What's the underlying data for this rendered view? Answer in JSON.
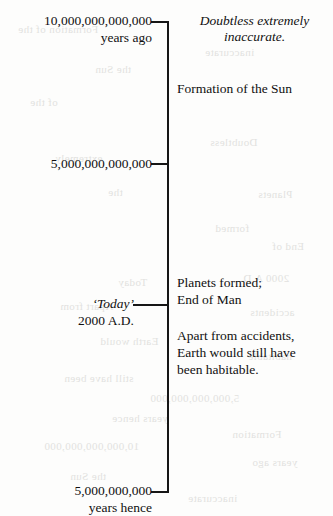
{
  "figure": {
    "type": "timeline",
    "orientation": "vertical",
    "axis_color": "#161616"
  },
  "ticks": [
    {
      "id": "ten-trillion-years-ago",
      "label_lines": [
        "10,000,000,000,000",
        "years ago"
      ],
      "position": "top"
    },
    {
      "id": "five-trillion-years-ago",
      "label_lines": [
        "5,000,000,000,000"
      ],
      "position": "upper-middle"
    },
    {
      "id": "today",
      "label_lines": [
        "‘Today’",
        "2000 A.D."
      ],
      "position": "lower-middle"
    },
    {
      "id": "five-billion-years-hence",
      "label_lines": [
        "5,000,000,000",
        "years hence"
      ],
      "position": "bottom"
    }
  ],
  "labels": {
    "top": {
      "line1": "10,000,000,000,000",
      "line2": "years ago"
    },
    "middle": {
      "line1": "5,000,000,000,000"
    },
    "today": {
      "line1": "‘Today’",
      "line2": "2000 A.D."
    },
    "bottom": {
      "line1": "5,000,000,000",
      "line2": "years hence"
    }
  },
  "annotations": {
    "caveat": {
      "line1": "Doubtless extremely",
      "line2": "inaccurate."
    },
    "sun": {
      "line1": "Formation of the Sun"
    },
    "planets": {
      "line1": "Planets formed;",
      "line2": "End of Man"
    },
    "habitable": {
      "line1": "Apart from accidents,",
      "line2": "Earth would still have",
      "line3": "been habitable."
    }
  },
  "ghosting": {
    "note": "faint mirrored show-through from the reverse side of the printed page",
    "marks": [
      {
        "text": "Formation of the",
        "x": 18,
        "y": 23
      },
      {
        "text": "inaccurate",
        "x": 205,
        "y": 46
      },
      {
        "text": "the Sun",
        "x": 95,
        "y": 63
      },
      {
        "text": "of the",
        "x": 30,
        "y": 96
      },
      {
        "text": "Doubtless",
        "x": 210,
        "y": 136
      },
      {
        "text": "extremely",
        "x": 55,
        "y": 152
      },
      {
        "text": "the",
        "x": 108,
        "y": 186
      },
      {
        "text": "Planets",
        "x": 258,
        "y": 188
      },
      {
        "text": "formed",
        "x": 215,
        "y": 222
      },
      {
        "text": "End of",
        "x": 272,
        "y": 240
      },
      {
        "text": "2000 A.D.",
        "x": 240,
        "y": 272
      },
      {
        "text": "Today",
        "x": 118,
        "y": 276
      },
      {
        "text": "Apart from",
        "x": 60,
        "y": 300
      },
      {
        "text": "accidents",
        "x": 250,
        "y": 306
      },
      {
        "text": "Earth would",
        "x": 100,
        "y": 335
      },
      {
        "text": "habitable",
        "x": 248,
        "y": 350
      },
      {
        "text": "still have been",
        "x": 64,
        "y": 372
      },
      {
        "text": "5,000,000,000,000",
        "x": 150,
        "y": 392
      },
      {
        "text": "years hence",
        "x": 112,
        "y": 412
      },
      {
        "text": "Formation",
        "x": 232,
        "y": 428
      },
      {
        "text": "10,000,000,000,000",
        "x": 44,
        "y": 440
      },
      {
        "text": "years ago",
        "x": 252,
        "y": 456
      },
      {
        "text": "the Sun",
        "x": 70,
        "y": 470
      },
      {
        "text": "inaccurate",
        "x": 188,
        "y": 492
      }
    ]
  }
}
